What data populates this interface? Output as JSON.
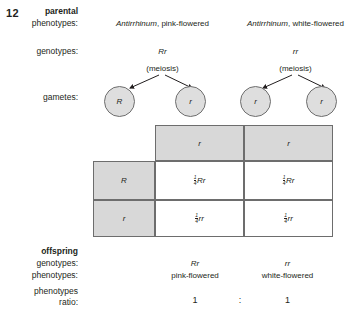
{
  "figure": {
    "number": "12",
    "type": "genetics-cross-diagram"
  },
  "labels": {
    "parental": "parental",
    "phenotypes": "phenotypes:",
    "genotypes": "genotypes:",
    "gametes": "gametes:",
    "offspring": "offspring",
    "offspring_genotypes": "genotypes:",
    "offspring_phenotypes": "phenotypes:",
    "phenotypes_line1": "phenotypes",
    "ratio": "ratio:"
  },
  "parents": {
    "left": {
      "species": "Antirrhinum",
      "phenotype": ", pink-flowered",
      "phenotype_full": "Antirrhinum, pink-flowered",
      "genotype": "Rr",
      "meiosis": "(meiosis)",
      "gametes": [
        "R",
        "r"
      ]
    },
    "right": {
      "species": "Antirrhinum",
      "phenotype": ", white-flowered",
      "phenotype_full": "Antirrhinum, white-flowered",
      "genotype": "rr",
      "meiosis": "(meiosis)",
      "gametes": [
        "r",
        "r"
      ]
    }
  },
  "punnett": {
    "column_headers": [
      "r",
      "r"
    ],
    "row_headers": [
      "R",
      "r"
    ],
    "cells": [
      [
        {
          "num": "1",
          "den": "4",
          "genotype": "Rr"
        },
        {
          "num": "1",
          "den": "4",
          "genotype": "Rr"
        }
      ],
      [
        {
          "num": "1",
          "den": "4",
          "genotype": "rr"
        },
        {
          "num": "1",
          "den": "4",
          "genotype": "rr"
        }
      ]
    ]
  },
  "offspring": {
    "columns": [
      {
        "genotype": "Rr",
        "phenotype": "pink-flowered",
        "ratio": "1"
      },
      {
        "genotype": "rr",
        "phenotype": "white-flowered",
        "ratio": "1"
      }
    ],
    "ratio_separator": ":"
  },
  "colors": {
    "shade": "#d8d8d8",
    "border": "#6d6d6d",
    "circle_fill": "#dedede",
    "circle_border": "#6e6e6e",
    "text": "#231f20"
  }
}
